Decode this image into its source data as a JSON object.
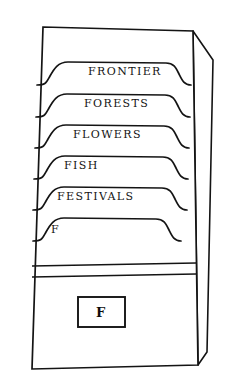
{
  "illustration": {
    "title": "file-box-with-labeled-folder-tabs",
    "stroke_color": "#141414",
    "background_color": "#ffffff"
  },
  "box": {
    "front_panel_name": "box-front-panel",
    "side_panel_name": "box-right-side-panel",
    "rim_band_name": "box-rim-band"
  },
  "folders": [
    {
      "label": "FRONTIER",
      "align": "center"
    },
    {
      "label": "FORESTS",
      "align": "center"
    },
    {
      "label": "FLOWERS",
      "align": "center"
    },
    {
      "label": "FISH",
      "align": "left"
    },
    {
      "label": "FESTIVALS",
      "align": "left"
    },
    {
      "label": "F",
      "align": "left"
    }
  ],
  "front_card": {
    "label": "F"
  }
}
